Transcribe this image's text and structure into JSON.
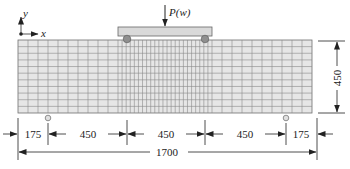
{
  "figure": {
    "type": "finite-element beam mesh diagram",
    "axes": {
      "x_label": "x",
      "y_label": "y"
    },
    "load": {
      "label": "P(w)"
    },
    "dimensions": {
      "height": "450",
      "total_length": "1700",
      "segments": [
        "175",
        "450",
        "450",
        "450",
        "175"
      ]
    },
    "mesh": {
      "left": 18,
      "right": 312,
      "top": 40,
      "bottom": 113,
      "rows": 11,
      "coarse_cell_width": 9.7,
      "fine_region": [
        118,
        212
      ],
      "fine_cell_width": 4.1
    },
    "colors": {
      "mesh_fill": "#e6e6e6",
      "mesh_line": "#8a8a8a",
      "loading_beam": "#d9d9d9",
      "roller": "#8f8f8f",
      "line": "#222222"
    }
  }
}
